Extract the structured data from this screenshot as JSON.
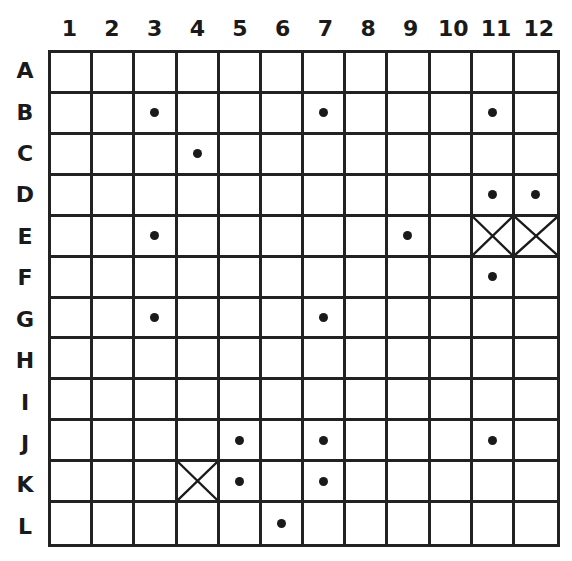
{
  "board": {
    "columns": [
      "1",
      "2",
      "3",
      "4",
      "5",
      "6",
      "7",
      "8",
      "9",
      "10",
      "11",
      "12"
    ],
    "rows": [
      "A",
      "B",
      "C",
      "D",
      "E",
      "F",
      "G",
      "H",
      "I",
      "J",
      "K",
      "L"
    ],
    "dots": [
      "B3",
      "B7",
      "B11",
      "C4",
      "D11",
      "D12",
      "E3",
      "E9",
      "F11",
      "G3",
      "G7",
      "J5",
      "J7",
      "J11",
      "K5",
      "K7",
      "L6"
    ],
    "crosses": [
      "E11",
      "E12",
      "K4"
    ]
  }
}
